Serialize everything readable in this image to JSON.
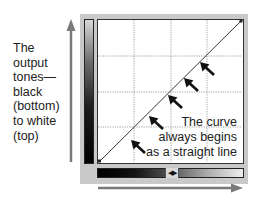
{
  "diagram": {
    "left_caption": {
      "lines": [
        "The",
        "output",
        "tones—",
        "black",
        "(bottom)",
        "to white",
        "(top)"
      ]
    },
    "right_caption": {
      "lines": [
        "The curve",
        "always begins",
        "as a straight line"
      ]
    },
    "slider": {
      "icon": "left-right-arrows",
      "glyph": "◀▶"
    },
    "grid": {
      "divisions": 4,
      "style": "dotted"
    },
    "curve": {
      "type": "straight-line",
      "start": "bottom-left (black, black)",
      "end": "top-right (white, white)"
    },
    "pointer_arrows": {
      "count": 5,
      "direction": "up-left toward curve"
    },
    "axes": {
      "vertical": "output tones: black (bottom) to white (top)",
      "horizontal": "input tones: black (left) to white (right)"
    },
    "colors": {
      "frame": "#c9c9c9",
      "axis_arrow": "#7a7a7a",
      "curve": "#333333",
      "pointer": "#111111",
      "grid": "#888888"
    }
  }
}
